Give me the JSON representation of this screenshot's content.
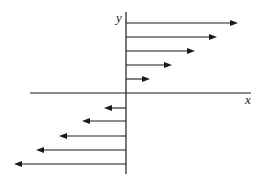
{
  "diagram": {
    "type": "vector-field",
    "axes": {
      "x_label": "x",
      "y_label": "y",
      "color": "#1a1a1a"
    },
    "origin": {
      "x": 126,
      "y": 93
    },
    "arrows": [
      {
        "y": 23,
        "tip_x": 238,
        "direction": "right"
      },
      {
        "y": 37,
        "tip_x": 217,
        "direction": "right"
      },
      {
        "y": 51,
        "tip_x": 195,
        "direction": "right"
      },
      {
        "y": 65,
        "tip_x": 172,
        "direction": "right"
      },
      {
        "y": 79,
        "tip_x": 150,
        "direction": "right"
      },
      {
        "y": 108,
        "tip_x": 104,
        "direction": "left"
      },
      {
        "y": 121,
        "tip_x": 82,
        "direction": "left"
      },
      {
        "y": 136,
        "tip_x": 59,
        "direction": "left"
      },
      {
        "y": 150,
        "tip_x": 36,
        "direction": "left"
      },
      {
        "y": 164,
        "tip_x": 14,
        "direction": "left"
      }
    ]
  }
}
